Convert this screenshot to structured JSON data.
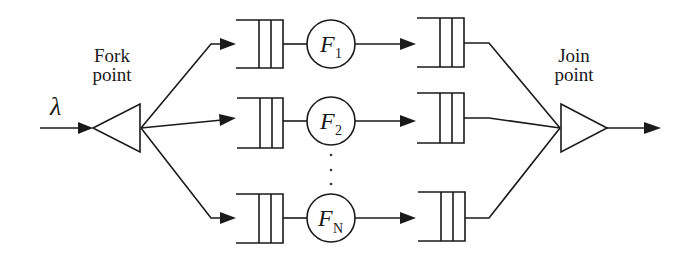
{
  "diagram": {
    "input": {
      "symbol": "λ"
    },
    "fork": {
      "label_line1": "Fork",
      "label_line2": "point"
    },
    "join": {
      "label_line1": "Join",
      "label_line2": "point"
    },
    "branches": [
      {
        "server_name": "F",
        "server_sub": "1"
      },
      {
        "server_name": "F",
        "server_sub": "2"
      },
      {
        "server_name": "F",
        "server_sub": "N"
      }
    ],
    "ellipsis": "⋮",
    "colors": {
      "stroke": "#1a1a1a",
      "background": "#ffffff"
    }
  }
}
